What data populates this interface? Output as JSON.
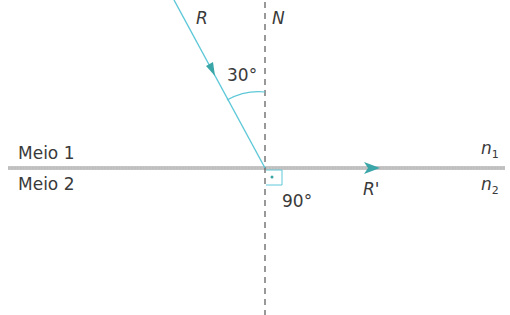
{
  "labels": {
    "incident_ray": "R",
    "normal": "N",
    "incidence_angle": "30°",
    "medium_1": "Meio 1",
    "medium_2": "Meio 2",
    "refracted_ray": "R'",
    "right_angle": "90°",
    "n1_base": "n",
    "n1_sub": "1",
    "n2_base": "n",
    "n2_sub": "2"
  },
  "colors": {
    "ray": "#5ec8d8",
    "arrow": "#3aa6a8",
    "interface": "#7a7a7a",
    "normal": "#555555",
    "text": "#3a3a3a"
  },
  "geometry": {
    "incidence_angle_deg": 30,
    "refraction_angle_deg": 90
  }
}
